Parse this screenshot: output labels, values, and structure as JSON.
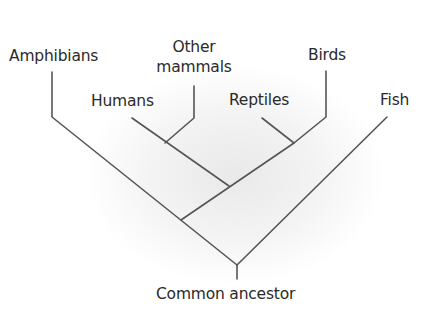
{
  "diagram": {
    "type": "cladogram",
    "line_color": "#555555",
    "taxa": {
      "amphibians": "Amphibians",
      "other_mammals_line1": "Other",
      "other_mammals_line2": "mammals",
      "humans": "Humans",
      "reptiles": "Reptiles",
      "birds": "Birds",
      "fish": "Fish"
    },
    "root_label": "Common ancestor"
  }
}
